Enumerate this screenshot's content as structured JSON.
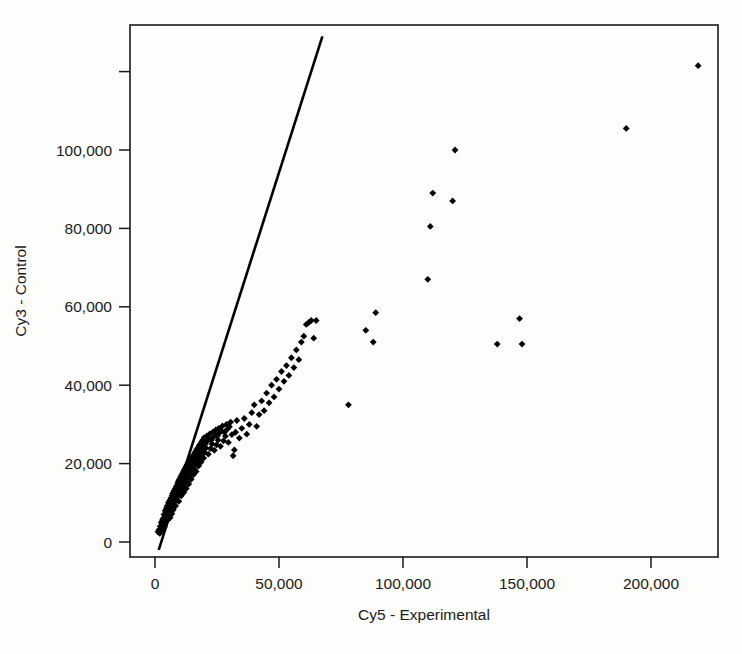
{
  "chart_data": {
    "type": "scatter",
    "title": "",
    "xlabel": "Cy5 - Experimental",
    "ylabel": "Cy3 - Control",
    "xlim": [
      -9000,
      227000
    ],
    "ylim": [
      -5000,
      129000
    ],
    "xticks": [
      0,
      50000,
      100000,
      150000,
      200000
    ],
    "xtick_labels": [
      "0",
      "50,000",
      "100,000",
      "150,000",
      "200,000"
    ],
    "yticks": [
      0,
      20000,
      40000,
      60000,
      80000,
      100000,
      120000
    ],
    "ytick_labels": [
      "0",
      "20,000",
      "40,000",
      "60,000",
      "80,000",
      "100,000",
      ""
    ],
    "grid": false,
    "legend": null,
    "point_color": "#000000",
    "point_marker": "filled-diamond",
    "reference_line": {
      "name": "identity-trend-line",
      "type": "line",
      "color": "#000000",
      "x": [
        1500,
        67500
      ],
      "y": [
        -2000,
        129000
      ],
      "slope": 1.985,
      "intercept": -4970
    },
    "points": [
      [
        1200,
        2600
      ],
      [
        1600,
        3100
      ],
      [
        1900,
        2200
      ],
      [
        2100,
        4000
      ],
      [
        2300,
        3300
      ],
      [
        2500,
        5000
      ],
      [
        2600,
        2800
      ],
      [
        2800,
        4300
      ],
      [
        3000,
        5600
      ],
      [
        3100,
        3600
      ],
      [
        3300,
        6000
      ],
      [
        3400,
        4600
      ],
      [
        3600,
        7000
      ],
      [
        3700,
        5200
      ],
      [
        3800,
        3900
      ],
      [
        4000,
        6400
      ],
      [
        4100,
        8000
      ],
      [
        4200,
        5000
      ],
      [
        4400,
        7200
      ],
      [
        4500,
        5800
      ],
      [
        4600,
        8600
      ],
      [
        4800,
        6600
      ],
      [
        4900,
        9200
      ],
      [
        5000,
        7400
      ],
      [
        5100,
        5600
      ],
      [
        5300,
        8200
      ],
      [
        5400,
        10000
      ],
      [
        5500,
        6900
      ],
      [
        5600,
        9000
      ],
      [
        5800,
        7600
      ],
      [
        5900,
        10600
      ],
      [
        6000,
        8400
      ],
      [
        6100,
        6200
      ],
      [
        6300,
        9600
      ],
      [
        6400,
        11200
      ],
      [
        6500,
        8000
      ],
      [
        6600,
        10200
      ],
      [
        6800,
        7200
      ],
      [
        6900,
        11800
      ],
      [
        7000,
        9000
      ],
      [
        7100,
        12400
      ],
      [
        7200,
        10000
      ],
      [
        7400,
        8200
      ],
      [
        7500,
        11000
      ],
      [
        7600,
        13000
      ],
      [
        7700,
        9600
      ],
      [
        7800,
        12000
      ],
      [
        8000,
        10400
      ],
      [
        8100,
        13600
      ],
      [
        8200,
        11400
      ],
      [
        8300,
        9200
      ],
      [
        8500,
        12600
      ],
      [
        8600,
        14200
      ],
      [
        8700,
        10800
      ],
      [
        8800,
        13200
      ],
      [
        9000,
        11600
      ],
      [
        9100,
        14800
      ],
      [
        9200,
        12200
      ],
      [
        9300,
        15400
      ],
      [
        9500,
        13000
      ],
      [
        9600,
        10400
      ],
      [
        9700,
        14000
      ],
      [
        9800,
        16000
      ],
      [
        10000,
        12000
      ],
      [
        10100,
        15000
      ],
      [
        10200,
        13400
      ],
      [
        10300,
        16600
      ],
      [
        10500,
        14400
      ],
      [
        10600,
        11800
      ],
      [
        10700,
        15600
      ],
      [
        10800,
        17200
      ],
      [
        11000,
        13000
      ],
      [
        11100,
        16200
      ],
      [
        11200,
        14600
      ],
      [
        11300,
        17800
      ],
      [
        11500,
        15200
      ],
      [
        11600,
        12600
      ],
      [
        11700,
        16800
      ],
      [
        11800,
        18400
      ],
      [
        12000,
        14000
      ],
      [
        12100,
        17400
      ],
      [
        12200,
        15800
      ],
      [
        12300,
        19000
      ],
      [
        12500,
        16400
      ],
      [
        12600,
        13600
      ],
      [
        12700,
        18000
      ],
      [
        12800,
        19600
      ],
      [
        13000,
        15200
      ],
      [
        13100,
        18600
      ],
      [
        13200,
        17000
      ],
      [
        13300,
        20200
      ],
      [
        13500,
        17600
      ],
      [
        13600,
        14800
      ],
      [
        13700,
        19200
      ],
      [
        13800,
        20800
      ],
      [
        14000,
        16400
      ],
      [
        14100,
        19800
      ],
      [
        14200,
        18200
      ],
      [
        14300,
        21000
      ],
      [
        14500,
        18800
      ],
      [
        14600,
        16000
      ],
      [
        14700,
        20400
      ],
      [
        14800,
        21600
      ],
      [
        15000,
        17600
      ],
      [
        15100,
        20000
      ],
      [
        15200,
        19400
      ],
      [
        15300,
        22000
      ],
      [
        15500,
        20600
      ],
      [
        15600,
        17200
      ],
      [
        15700,
        21200
      ],
      [
        15800,
        22400
      ],
      [
        16000,
        18600
      ],
      [
        16100,
        21800
      ],
      [
        16200,
        20200
      ],
      [
        16300,
        23000
      ],
      [
        16500,
        21400
      ],
      [
        16600,
        18000
      ],
      [
        16700,
        22600
      ],
      [
        16800,
        23600
      ],
      [
        17000,
        19800
      ],
      [
        17100,
        22200
      ],
      [
        17200,
        21000
      ],
      [
        17300,
        24000
      ],
      [
        17500,
        22800
      ],
      [
        17600,
        19400
      ],
      [
        17700,
        23400
      ],
      [
        17800,
        24600
      ],
      [
        18000,
        20800
      ],
      [
        18100,
        23000
      ],
      [
        18200,
        22000
      ],
      [
        18300,
        25000
      ],
      [
        18500,
        23800
      ],
      [
        18600,
        20400
      ],
      [
        18700,
        24400
      ],
      [
        18800,
        25600
      ],
      [
        19000,
        21800
      ],
      [
        19100,
        24000
      ],
      [
        19200,
        23000
      ],
      [
        19300,
        26000
      ],
      [
        19500,
        24800
      ],
      [
        19600,
        21400
      ],
      [
        19700,
        25400
      ],
      [
        19800,
        26600
      ],
      [
        20000,
        22800
      ],
      [
        20300,
        25000
      ],
      [
        20600,
        24000
      ],
      [
        20900,
        27000
      ],
      [
        21200,
        25800
      ],
      [
        21500,
        22400
      ],
      [
        21800,
        26400
      ],
      [
        22100,
        27600
      ],
      [
        22400,
        23800
      ],
      [
        22700,
        26000
      ],
      [
        23000,
        25000
      ],
      [
        23300,
        28000
      ],
      [
        23600,
        26800
      ],
      [
        23900,
        23400
      ],
      [
        24200,
        27400
      ],
      [
        24500,
        28600
      ],
      [
        24800,
        24800
      ],
      [
        25100,
        27000
      ],
      [
        25400,
        26000
      ],
      [
        25700,
        29000
      ],
      [
        26000,
        27800
      ],
      [
        26400,
        24400
      ],
      [
        26800,
        28400
      ],
      [
        27200,
        29600
      ],
      [
        27600,
        25800
      ],
      [
        28000,
        28000
      ],
      [
        28400,
        27000
      ],
      [
        28800,
        30000
      ],
      [
        29200,
        28800
      ],
      [
        29600,
        25400
      ],
      [
        30000,
        29400
      ],
      [
        30500,
        30600
      ],
      [
        31000,
        27400
      ],
      [
        31500,
        22000
      ],
      [
        32000,
        23500
      ],
      [
        32500,
        28000
      ],
      [
        33000,
        31000
      ],
      [
        34000,
        26500
      ],
      [
        35000,
        29000
      ],
      [
        36000,
        31500
      ],
      [
        37000,
        27500
      ],
      [
        38000,
        30000
      ],
      [
        39000,
        33000
      ],
      [
        40000,
        35000
      ],
      [
        41000,
        29500
      ],
      [
        42000,
        32500
      ],
      [
        43000,
        36000
      ],
      [
        44000,
        33500
      ],
      [
        45000,
        38000
      ],
      [
        46000,
        35500
      ],
      [
        47000,
        40000
      ],
      [
        48000,
        37000
      ],
      [
        49000,
        41500
      ],
      [
        50000,
        39000
      ],
      [
        51000,
        43500
      ],
      [
        52000,
        41000
      ],
      [
        53000,
        45000
      ],
      [
        54000,
        42500
      ],
      [
        55000,
        47000
      ],
      [
        56000,
        44500
      ],
      [
        57000,
        49000
      ],
      [
        58000,
        46500
      ],
      [
        59000,
        51000
      ],
      [
        60000,
        52500
      ],
      [
        61000,
        55500
      ],
      [
        62000,
        56000
      ],
      [
        63000,
        56500
      ],
      [
        64000,
        52000
      ],
      [
        65000,
        56500
      ],
      [
        78000,
        35000
      ],
      [
        85000,
        54000
      ],
      [
        88000,
        51000
      ],
      [
        89000,
        58500
      ],
      [
        110000,
        67000
      ],
      [
        111000,
        80500
      ],
      [
        112000,
        89000
      ],
      [
        120000,
        87000
      ],
      [
        121000,
        100000
      ],
      [
        138000,
        50500
      ],
      [
        147000,
        57000
      ],
      [
        148000,
        50500
      ],
      [
        190000,
        105500
      ],
      [
        219000,
        121500
      ]
    ]
  },
  "layout": {
    "plot_left_px": 130,
    "plot_right_px": 718,
    "plot_top_px": 25,
    "plot_bottom_px": 557,
    "x_zero_px": 155,
    "x_per_50k_px": 124,
    "y_zero_px": 542,
    "y_per_20k_px": 78.4
  }
}
